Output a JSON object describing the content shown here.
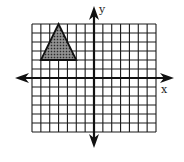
{
  "figure": {
    "type": "coordinate-plane",
    "grid": {
      "x_min": -7,
      "x_max": 7,
      "y_min": -6,
      "y_max": 6,
      "step": 1
    },
    "axes": {
      "x_label": "x",
      "y_label": "y"
    },
    "shapes": [
      {
        "type": "triangle",
        "fill": "shaded",
        "vertices": [
          [
            -4,
            6
          ],
          [
            -6,
            2
          ],
          [
            -2,
            2
          ]
        ]
      }
    ]
  },
  "colors": {
    "grid": "#1a1a1a",
    "axis": "#111111",
    "shape_fill": "#555555",
    "background": "#ffffff"
  }
}
